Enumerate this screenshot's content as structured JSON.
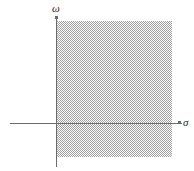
{
  "figure": {
    "width": 194,
    "height": 171,
    "background_color": "#ffffff"
  },
  "axes": {
    "horizontal": {
      "label": "σ",
      "name": "sigma",
      "meaning": "real axis",
      "color": "#6b6b6b",
      "y_position_px": 123,
      "x_start_px": 10,
      "x_end_px": 182
    },
    "vertical": {
      "label": "ω",
      "name": "omega",
      "meaning": "imaginary axis",
      "color": "#6b6b6b",
      "x_position_px": 56,
      "y_start_px": 17,
      "y_end_px": 167
    }
  },
  "shaded_region": {
    "name": "right-half-plane",
    "description": "hatched region",
    "fill_color": "#9a9a9a",
    "pattern": "diagonal-hatch",
    "left_px": 56,
    "top_px": 21,
    "width_px": 116,
    "height_px": 136
  },
  "chart_data": {
    "type": "scatter",
    "title": "",
    "xlabel": "σ",
    "ylabel": "ω",
    "grid": false,
    "legend": null,
    "annotations": [
      {
        "text": "σ",
        "role": "x-axis-label",
        "x_px": 183,
        "y_px": 122
      },
      {
        "text": "ω",
        "role": "y-axis-label",
        "x_px": 55,
        "y_px": 9
      }
    ],
    "shaded_regions": [
      {
        "name": "right-half-plane",
        "x_range": [
          0,
          2.9
        ],
        "y_range": [
          -0.85,
          2.55
        ],
        "fill": "#9a9a9a",
        "hatch": true
      }
    ],
    "origin_px": {
      "x": 56,
      "y": 123
    },
    "series": []
  }
}
